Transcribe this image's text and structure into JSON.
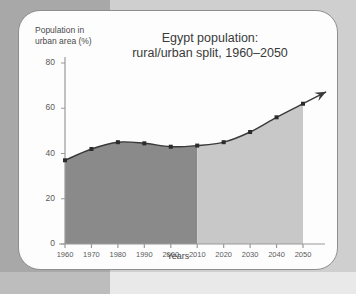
{
  "chart_data": {
    "type": "area",
    "title": "Egypt population:\nrural/urban split, 1960–2050",
    "title_line1": "Egypt population:",
    "title_line2": "rural/urban split, 1960–2050",
    "xlabel": "Years",
    "ylabel": "Population in\nurban area (%)",
    "ylabel_line1": "Population in",
    "ylabel_line2": "urban area (%)",
    "x": [
      1960,
      1970,
      1980,
      1990,
      2000,
      2010,
      2020,
      2030,
      2040,
      2050
    ],
    "values": [
      37,
      42,
      45,
      44.5,
      43,
      43.5,
      45,
      49.5,
      56,
      62
    ],
    "categories": [
      "1960",
      "1970",
      "1980",
      "1990",
      "2000",
      "2010",
      "2020",
      "2030",
      "2040",
      "2050"
    ],
    "xlim": [
      1960,
      2050
    ],
    "ylim": [
      0,
      80
    ],
    "yticks": [
      0,
      20,
      40,
      60,
      80
    ],
    "ytick_labels": [
      "0",
      "20",
      "40",
      "60",
      "80"
    ],
    "xticks": [
      1960,
      1970,
      1980,
      1990,
      2000,
      2010,
      2020,
      2030,
      2040,
      2050
    ],
    "xtick_labels": [
      "1960",
      "1970",
      "1980",
      "1990",
      "2000",
      "2010",
      "2020",
      "2030",
      "2040",
      "2050"
    ],
    "grid": false,
    "legend": "none",
    "split_year": 2010,
    "annotations": [
      "arrow at end of line extending beyond 2050"
    ],
    "colors": {
      "fill_historical": "#8a8a8a",
      "fill_projection": "#c8c8c8",
      "line": "#3a3a3a",
      "marker": "#2b2b2b",
      "axis": "#9a9a9a",
      "text": "#4a4a4a",
      "card_background": "#fdfdfd",
      "card_border": "#8e8e8e",
      "page_background": "#cfcfcf",
      "page_band_left": "#a8a8a8"
    }
  }
}
